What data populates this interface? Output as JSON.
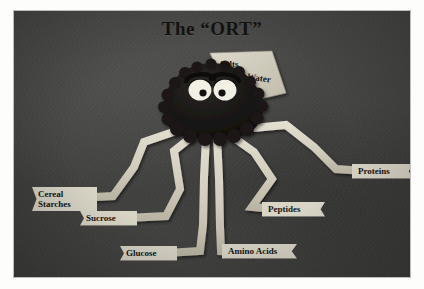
{
  "poster": {
    "title": "The “ORT”",
    "medium": "photographed print",
    "background_color": "#444442",
    "plate_border_color": "#fdfdfc",
    "ribbon_color": "#d8d4c6",
    "body_color": "#1c1a18",
    "text_color": "#15140f"
  },
  "character": {
    "name": "ort-creature",
    "description": "octopus-like figure with dark fuzzy body and pale ribbon legs",
    "eyes": {
      "left": "white oval with dark pupil and heavy droopy lid",
      "right": "white oval with dark pupil and heavy droopy lid"
    }
  },
  "fan_banner": {
    "items": [
      {
        "id": "salts",
        "label": "Salts"
      },
      {
        "id": "water",
        "label": "Water"
      }
    ]
  },
  "leg_labels": [
    {
      "id": "cereal-starches",
      "label": "Cereal\nStarches"
    },
    {
      "id": "sucrose",
      "label": "Sucrose"
    },
    {
      "id": "glucose",
      "label": "Glucose"
    },
    {
      "id": "amino-acids",
      "label": "Amino Acids"
    },
    {
      "id": "peptides",
      "label": "Peptides"
    },
    {
      "id": "proteins",
      "label": "Proteins"
    }
  ]
}
